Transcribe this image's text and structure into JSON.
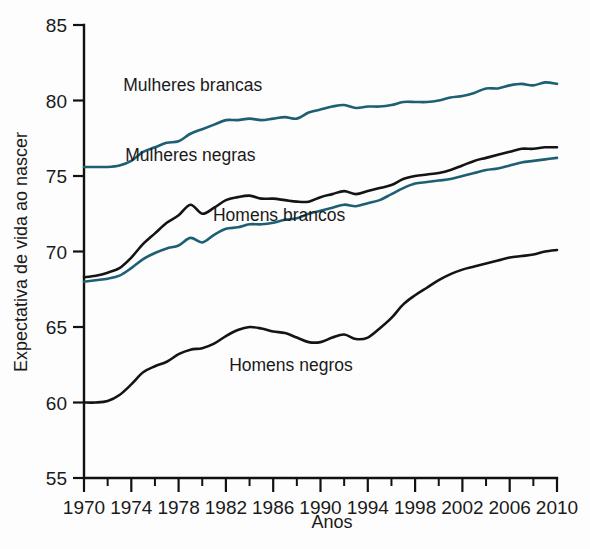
{
  "chart_data": {
    "type": "line",
    "title": "",
    "xlabel": "Anos",
    "ylabel": "Expectativa de vida ao nascer",
    "xlim": [
      1970,
      2010
    ],
    "ylim": [
      55,
      85
    ],
    "grid": false,
    "legend_position": "inline-annotations",
    "x_ticks_major": [
      1970,
      1974,
      1978,
      1982,
      1986,
      1990,
      1994,
      1998,
      2002,
      2006,
      2010
    ],
    "x_ticks_minor": [
      1972,
      1976,
      1980,
      1984,
      1988,
      1992,
      1996,
      2000,
      2004,
      2008
    ],
    "y_ticks": [
      55,
      60,
      65,
      70,
      75,
      80,
      85
    ],
    "x": [
      1970,
      1971,
      1972,
      1973,
      1974,
      1975,
      1976,
      1977,
      1978,
      1979,
      1980,
      1981,
      1982,
      1983,
      1984,
      1985,
      1986,
      1987,
      1988,
      1989,
      1990,
      1991,
      1992,
      1993,
      1994,
      1995,
      1996,
      1997,
      1998,
      1999,
      2000,
      2001,
      2002,
      2003,
      2004,
      2005,
      2006,
      2007,
      2008,
      2009,
      2010
    ],
    "series": [
      {
        "name": "Mulheres brancas",
        "color": "#1d5f73",
        "label_x": 1979.2,
        "label_y": 80.6,
        "values": [
          75.6,
          75.6,
          75.6,
          75.7,
          76.0,
          76.6,
          76.9,
          77.2,
          77.3,
          77.8,
          78.1,
          78.4,
          78.7,
          78.7,
          78.8,
          78.7,
          78.8,
          78.9,
          78.8,
          79.2,
          79.4,
          79.6,
          79.7,
          79.5,
          79.6,
          79.6,
          79.7,
          79.9,
          79.9,
          79.9,
          80.0,
          80.2,
          80.3,
          80.5,
          80.8,
          80.8,
          81.0,
          81.1,
          81.0,
          81.2,
          81.1
        ]
      },
      {
        "name": "Mulheres negras",
        "color": "#141414",
        "label_x": 1979.0,
        "label_y": 76.0,
        "values": [
          68.3,
          68.4,
          68.6,
          68.9,
          69.6,
          70.5,
          71.2,
          71.9,
          72.4,
          73.1,
          72.5,
          72.9,
          73.4,
          73.6,
          73.7,
          73.5,
          73.5,
          73.4,
          73.3,
          73.3,
          73.6,
          73.8,
          74.0,
          73.8,
          74.0,
          74.2,
          74.4,
          74.8,
          75.0,
          75.1,
          75.2,
          75.4,
          75.7,
          76.0,
          76.2,
          76.4,
          76.6,
          76.8,
          76.8,
          76.9,
          76.9
        ]
      },
      {
        "name": "Homens brancos",
        "color": "#1d5f73",
        "label_x": 1986.5,
        "label_y": 72.0,
        "values": [
          68.0,
          68.1,
          68.2,
          68.4,
          68.9,
          69.5,
          69.9,
          70.2,
          70.4,
          70.9,
          70.6,
          71.1,
          71.5,
          71.6,
          71.8,
          71.8,
          71.9,
          72.1,
          72.2,
          72.5,
          72.7,
          72.9,
          73.1,
          73.0,
          73.2,
          73.4,
          73.8,
          74.2,
          74.5,
          74.6,
          74.7,
          74.8,
          75.0,
          75.2,
          75.4,
          75.5,
          75.7,
          75.9,
          76.0,
          76.1,
          76.2
        ]
      },
      {
        "name": "Homens negros",
        "color": "#141414",
        "label_x": 1987.5,
        "label_y": 62.1,
        "values": [
          60.0,
          60.0,
          60.1,
          60.5,
          61.2,
          62.0,
          62.4,
          62.7,
          63.2,
          63.5,
          63.6,
          63.9,
          64.4,
          64.8,
          65.0,
          64.9,
          64.7,
          64.6,
          64.3,
          64.0,
          64.0,
          64.3,
          64.5,
          64.2,
          64.3,
          64.9,
          65.6,
          66.5,
          67.1,
          67.6,
          68.1,
          68.5,
          68.8,
          69.0,
          69.2,
          69.4,
          69.6,
          69.7,
          69.8,
          70.0,
          70.1
        ]
      }
    ]
  }
}
